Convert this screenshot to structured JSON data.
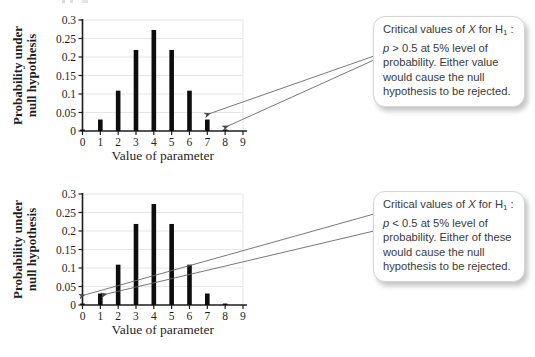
{
  "colors": {
    "bar": "#0d0d0d",
    "axis": "#1c1c1c",
    "grid": "#e3e3e6",
    "arrow": "#6a6a6a",
    "arrowhead": "#4a4a4a"
  },
  "chart_data": [
    {
      "type": "bar",
      "title": "",
      "x": [
        0,
        1,
        2,
        3,
        4,
        5,
        6,
        7,
        8
      ],
      "values": [
        0.004,
        0.031,
        0.109,
        0.219,
        0.273,
        0.219,
        0.109,
        0.031,
        0.004
      ],
      "xlabel": "Value of parameter",
      "ylabel": "Probability under null hypothesis",
      "ylabel_line1": "Probability under",
      "ylabel_line2": "null hypothesis",
      "xlim": [
        0,
        9
      ],
      "ylim": [
        0,
        0.3
      ],
      "xticks": [
        0,
        1,
        2,
        3,
        4,
        5,
        6,
        7,
        8,
        9
      ],
      "xtick_labels": [
        "0",
        "1",
        "2",
        "3",
        "4",
        "5",
        "6",
        "7",
        "8",
        "9"
      ],
      "yticks": [
        0,
        0.05,
        0.1,
        0.15,
        0.2,
        0.25,
        0.3
      ],
      "ytick_labels": [
        "0",
        "0.05",
        "0.1",
        "0.15",
        "0.2",
        "0.25",
        "0.3"
      ],
      "grid": true,
      "legend": null,
      "annotated_bars": [
        7,
        8
      ]
    },
    {
      "type": "bar",
      "title": "",
      "x": [
        0,
        1,
        2,
        3,
        4,
        5,
        6,
        7,
        8
      ],
      "values": [
        0.004,
        0.031,
        0.109,
        0.219,
        0.273,
        0.219,
        0.109,
        0.031,
        0.004
      ],
      "xlabel": "Value of parameter",
      "ylabel": "Probability under null hypothesis",
      "ylabel_line1": "Probability under",
      "ylabel_line2": "null hypothesis",
      "xlim": [
        0,
        9
      ],
      "ylim": [
        0,
        0.3
      ],
      "xticks": [
        0,
        1,
        2,
        3,
        4,
        5,
        6,
        7,
        8,
        9
      ],
      "xtick_labels": [
        "0",
        "1",
        "2",
        "3",
        "4",
        "5",
        "6",
        "7",
        "8",
        "9"
      ],
      "yticks": [
        0,
        0.05,
        0.1,
        0.15,
        0.2,
        0.25,
        0.3
      ],
      "ytick_labels": [
        "0",
        "0.05",
        "0.1",
        "0.15",
        "0.2",
        "0.25",
        "0.3"
      ],
      "grid": true,
      "legend": null,
      "annotated_bars": [
        0,
        1
      ]
    }
  ],
  "callouts": [
    {
      "seg1": "Critical values of ",
      "var1": "X",
      "seg2": " for H",
      "sub": "1",
      "seg3": " : ",
      "var2": "p",
      "seg4": " > 0.5 at 5% level of probability. Either value would cause the null hypothesis to be rejected."
    },
    {
      "seg1": "Critical values of ",
      "var1": "X",
      "seg2": " for H",
      "sub": "1",
      "seg3": " : ",
      "var2": "p",
      "seg4": " < 0.5 at 5% level of probability. Either of these would cause the null hypothesis to be rejected."
    }
  ],
  "arrows": {
    "fig1": [
      {
        "x1": 374,
        "y1": 56,
        "x2": 210,
        "y2": 113.5
      },
      {
        "x1": 374,
        "y1": 60,
        "x2": 228,
        "y2": 126
      }
    ],
    "fig2": [
      {
        "x1": 374,
        "y1": 40,
        "x2": 84.5,
        "y2": 121
      },
      {
        "x1": 374,
        "y1": 57,
        "x2": 106.5,
        "y2": 120
      }
    ]
  }
}
